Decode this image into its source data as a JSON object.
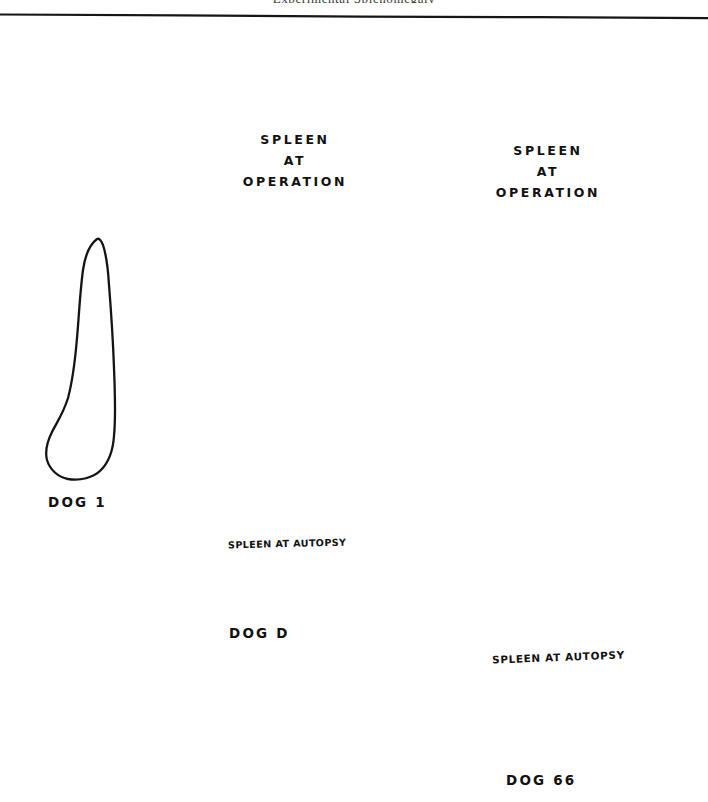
{
  "page": {
    "running_head_fragment": "Experimental Splenomegaly",
    "background_color": "#ffffff",
    "ink_color": "#141414"
  },
  "figure": {
    "caption_at_operation": "SPLEEN AT OPERATION",
    "caption_at_autopsy": "SPLEEN AT AUTOPSY",
    "specimens": [
      {
        "id": "dog-1",
        "label": "DOG 1",
        "label_x": 48,
        "label_y": 494,
        "outlines": [
          "autopsy"
        ],
        "has_operation_outline": false,
        "has_autopsy_outline": true,
        "operation_caption": "",
        "autopsy_caption": ""
      },
      {
        "id": "dog-d",
        "label": "DOG D",
        "label_x": 229,
        "label_y": 625,
        "outlines": [
          "operation",
          "autopsy"
        ],
        "has_operation_outline": true,
        "has_autopsy_outline": true,
        "operation_caption_line1": "SPLEEN",
        "operation_caption_line2": "AT",
        "operation_caption_line3": "OPERATION",
        "autopsy_caption": "SPLEEN AT AUTOPSY"
      },
      {
        "id": "dog-66",
        "label": "DOG 66",
        "label_x": 506,
        "label_y": 772,
        "outlines": [
          "operation",
          "autopsy"
        ],
        "has_operation_outline": true,
        "has_autopsy_outline": true,
        "operation_caption_line1": "SPLEEN",
        "operation_caption_line2": "AT",
        "operation_caption_line3": "OPERATION",
        "autopsy_caption": "SPLEEN AT AUTOPSY"
      }
    ]
  }
}
